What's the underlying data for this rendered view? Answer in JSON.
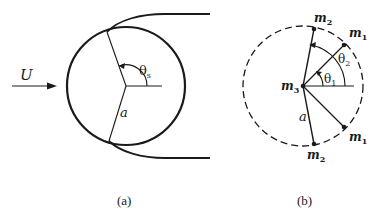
{
  "figure_a": {
    "caption": "(a)",
    "flow_label": "U",
    "angle_label": "θ",
    "angle_subscript": "s",
    "radius_label": "a"
  },
  "figure_b": {
    "caption": "(b)",
    "center_label": "m",
    "center_sub": "3",
    "top_label": "m",
    "top_sub": "2",
    "upper_right_label": "m",
    "upper_right_sub": "1",
    "lower_right_label": "m",
    "lower_right_sub": "1",
    "bottom_label": "m",
    "bottom_sub": "2",
    "angle1_label": "θ",
    "angle1_sub": "1",
    "angle2_label": "θ",
    "angle2_sub": "2",
    "radius_label": "a"
  },
  "colors": {
    "ink": "#1a1a1a",
    "background": "#ffffff"
  }
}
